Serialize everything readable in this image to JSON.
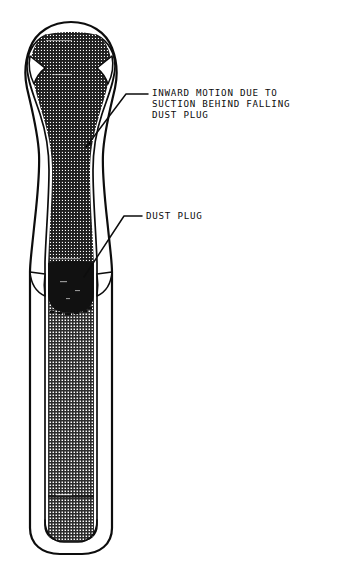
{
  "figure": {
    "background_color": "#ffffff",
    "ink_color": "#0d0d0d",
    "fill_solid_color": "#111111",
    "stipple_color": "#3a3a3a"
  },
  "annotations": [
    {
      "id": "inward-motion",
      "lines": [
        "INWARD MOTION DUE TO",
        "SUCTION BEHIND FALLING",
        "DUST PLUG"
      ],
      "text_x": 152,
      "text_y": 96,
      "line_height": 11,
      "leader": {
        "has_arrowhead": true,
        "points": "148,94 126,94 86,147"
      }
    },
    {
      "id": "dust-plug",
      "lines": [
        "DUST PLUG"
      ],
      "text_x": 146,
      "text_y": 219,
      "line_height": 11,
      "leader": {
        "has_arrowhead": false,
        "points": "142,216 124,216 84,277"
      }
    }
  ],
  "tube": {
    "parts": [
      {
        "name": "bulb-top",
        "label": "Rounded bulbous top of tube"
      },
      {
        "name": "tapered-neck",
        "label": "Tapered narrowing neck (waist)"
      },
      {
        "name": "dust-plug-mass",
        "label": "Solid dark dust plug"
      },
      {
        "name": "lower-barrel",
        "label": "Straight cylindrical lower barrel"
      },
      {
        "name": "bottom-cap",
        "label": "Rounded bottom end"
      },
      {
        "name": "cross-band",
        "label": "Horizontal band near bottom"
      }
    ]
  }
}
